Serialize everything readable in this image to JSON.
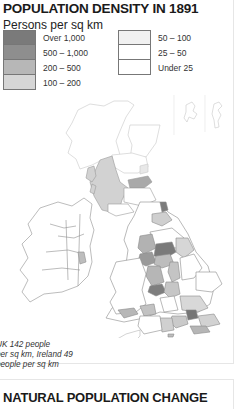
{
  "map": {
    "title": "POPULATION DENSITY IN 1891",
    "subtitle": "Persons per sq km",
    "legend": {
      "left": [
        {
          "label": "Over 1,000",
          "color": "#7a7a7a"
        },
        {
          "label": "500 – 1,000",
          "color": "#8e8e8e"
        },
        {
          "label": "200 – 500",
          "color": "#b7b7b7"
        },
        {
          "label": "100 – 200",
          "color": "#d6d6d6"
        }
      ],
      "right": [
        {
          "label": "50 – 100",
          "color": "#f1f1f1"
        },
        {
          "label": "25 – 50",
          "color": "#ffffff"
        },
        {
          "label": "Under 25",
          "color": "#ffffff"
        }
      ]
    },
    "note": "UK 142 people per sq km, Ireland 49 people per sq km",
    "note_lines": [
      "UK 142 people",
      "per sq km, Ireland 49",
      "people per sq km"
    ]
  },
  "next_section": {
    "title": "NATURAL POPULATION CHANGE"
  }
}
